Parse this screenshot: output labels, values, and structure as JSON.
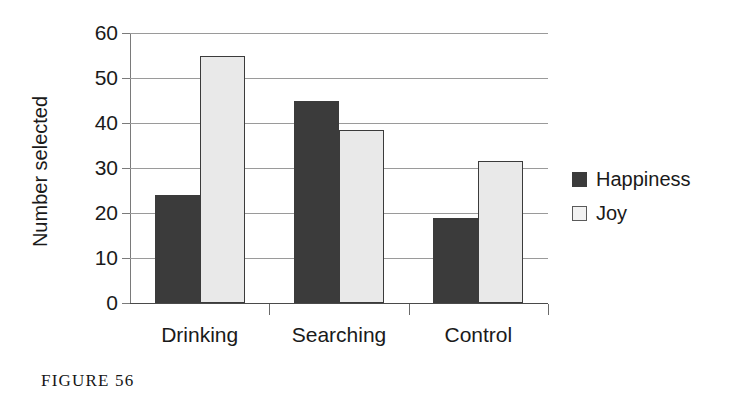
{
  "caption": "FIGURE 56",
  "chart_data": {
    "type": "bar",
    "title": "",
    "xlabel": "",
    "ylabel": "Number selected",
    "categories": [
      "Drinking",
      "Searching",
      "Control"
    ],
    "series": [
      {
        "name": "Happiness",
        "color": "#3b3b3b",
        "values": [
          24,
          45,
          19
        ]
      },
      {
        "name": "Joy",
        "color": "#e9e9e9",
        "values": [
          55,
          38.5,
          31.5
        ]
      }
    ],
    "ylim": [
      0,
      60
    ],
    "yticks": [
      0,
      10,
      20,
      30,
      40,
      50,
      60
    ],
    "ytick_labels": [
      "0",
      "10",
      "20",
      "30",
      "40",
      "50",
      "60"
    ],
    "grid": true,
    "grid_axis": "y",
    "legend_position": "right"
  }
}
